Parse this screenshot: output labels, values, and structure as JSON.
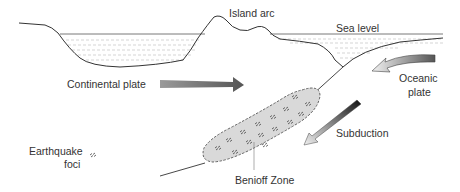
{
  "diagram": {
    "type": "geology-cross-section",
    "labels": {
      "island_arc": "Island arc",
      "sea_level": "Sea level",
      "continental_plate": "Continental plate",
      "oceanic_plate_line1": "Oceanic",
      "oceanic_plate_line2": "plate",
      "subduction": "Subduction",
      "earthquake_foci_line1": "Earthquake",
      "earthquake_foci_line2": "foci",
      "benioff_zone": "Benioff Zone"
    },
    "colors": {
      "line": "#333333",
      "water_dash": "#aaaaaa",
      "zone_fill": "#d9d9d9",
      "zone_border": "#555555",
      "arrow_dark": "#555555",
      "arrow_light": "#e0e0e0",
      "text": "#333333"
    }
  }
}
